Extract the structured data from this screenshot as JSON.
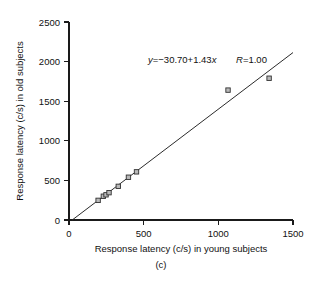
{
  "figure": {
    "caption": "(c)",
    "background_color": "#ffffff",
    "ink_color": "#1a1a1a"
  },
  "chart_data": {
    "type": "scatter",
    "title": "",
    "subtitle": "",
    "xlabel": "Response latency (c/s) in young subjects",
    "ylabel": "Response latency (c/s) in old subjects",
    "xlim": [
      0,
      1500
    ],
    "ylim": [
      0,
      2500
    ],
    "xticks": [
      0,
      500,
      1000,
      1500
    ],
    "yticks": [
      0,
      500,
      1000,
      1500,
      2000,
      2500
    ],
    "xtick_labels": [
      "0",
      "500",
      "1000",
      "1500"
    ],
    "ytick_labels": [
      "0",
      "500",
      "1000",
      "1500",
      "2000",
      "2500"
    ],
    "grid": false,
    "legend": null,
    "marker_style": "open-square",
    "marker_fill": "#b9b9b9",
    "marker_edge": "#303030",
    "series": [
      {
        "name": "subject pairs",
        "x": [
          195,
          230,
          248,
          268,
          330,
          398,
          452,
          1065,
          1340
        ],
        "y": [
          248,
          300,
          318,
          345,
          425,
          540,
          608,
          1640,
          1790
        ]
      }
    ],
    "fit_line": {
      "slope": 1.43,
      "intercept": -30.7,
      "r": 1.0,
      "x_start": 21,
      "x_end": 1500,
      "equation_label": "y=−30.70+1.43x",
      "r_label": "R=1.00",
      "equation_prefix_italic": "y",
      "equation_body": "=−30.70+1.43",
      "equation_suffix_italic": "x",
      "r_prefix_italic": "R",
      "r_body": "=1.00"
    },
    "annotations": [
      {
        "text": "y=−30.70+1.43x",
        "x_frac": 0.46,
        "y_frac": 0.215
      },
      {
        "text": "R=1.00",
        "x_frac": 0.735,
        "y_frac": 0.215
      }
    ]
  }
}
